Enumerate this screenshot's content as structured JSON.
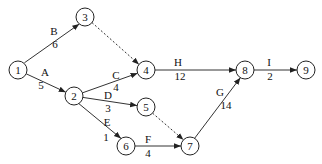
{
  "diagram": {
    "type": "activity-on-arrow network",
    "nodes": [
      {
        "id": "1",
        "label": "1",
        "x": 18,
        "y": 70
      },
      {
        "id": "2",
        "label": "2",
        "x": 74,
        "y": 96
      },
      {
        "id": "3",
        "label": "3",
        "x": 85,
        "y": 17
      },
      {
        "id": "4",
        "label": "4",
        "x": 146,
        "y": 70
      },
      {
        "id": "5",
        "label": "5",
        "x": 146,
        "y": 107
      },
      {
        "id": "6",
        "label": "6",
        "x": 126,
        "y": 146
      },
      {
        "id": "7",
        "label": "7",
        "x": 190,
        "y": 146
      },
      {
        "id": "8",
        "label": "8",
        "x": 245,
        "y": 70
      },
      {
        "id": "9",
        "label": "9",
        "x": 306,
        "y": 70
      }
    ],
    "edges": [
      {
        "from": "1",
        "to": "3",
        "activity": "B",
        "duration": "6",
        "dashed": false
      },
      {
        "from": "1",
        "to": "2",
        "activity": "A",
        "duration": "5",
        "dashed": false
      },
      {
        "from": "3",
        "to": "4",
        "activity": "",
        "duration": "",
        "dashed": true
      },
      {
        "from": "2",
        "to": "4",
        "activity": "C",
        "duration": "4",
        "dashed": false
      },
      {
        "from": "2",
        "to": "5",
        "activity": "D",
        "duration": "3",
        "dashed": false
      },
      {
        "from": "2",
        "to": "6",
        "activity": "E",
        "duration": "1",
        "dashed": false
      },
      {
        "from": "5",
        "to": "7",
        "activity": "",
        "duration": "",
        "dashed": true
      },
      {
        "from": "6",
        "to": "7",
        "activity": "F",
        "duration": "4",
        "dashed": false
      },
      {
        "from": "4",
        "to": "8",
        "activity": "H",
        "duration": "12",
        "dashed": false
      },
      {
        "from": "7",
        "to": "8",
        "activity": "G",
        "duration": "14",
        "dashed": false
      },
      {
        "from": "8",
        "to": "9",
        "activity": "I",
        "duration": "2",
        "dashed": false
      }
    ]
  },
  "labels": {
    "B": {
      "activity": "B",
      "duration": "6"
    },
    "A": {
      "activity": "A",
      "duration": "5"
    },
    "C": {
      "activity": "C",
      "duration": "4"
    },
    "D": {
      "activity": "D",
      "duration": "3"
    },
    "E": {
      "activity": "E",
      "duration": "1"
    },
    "F": {
      "activity": "F",
      "duration": "4"
    },
    "G": {
      "activity": "G",
      "duration": "14"
    },
    "H": {
      "activity": "H",
      "duration": "12"
    },
    "I": {
      "activity": "I",
      "duration": "2"
    }
  },
  "node_labels": [
    "1",
    "2",
    "3",
    "4",
    "5",
    "6",
    "7",
    "8",
    "9"
  ]
}
